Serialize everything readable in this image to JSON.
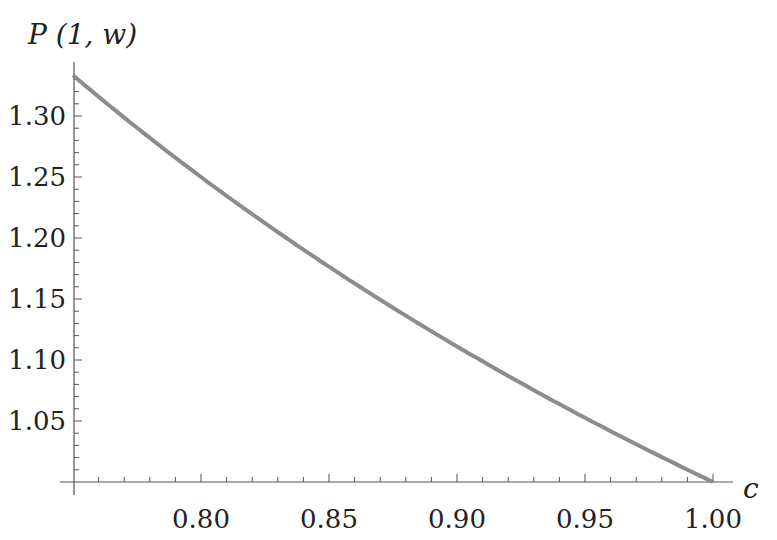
{
  "chart_data": {
    "type": "line",
    "title": "",
    "xlabel": "c",
    "ylabel": "P (1, w)",
    "xlim": [
      0.75,
      1.0
    ],
    "ylim": [
      1.0,
      1.3333
    ],
    "x_ticks": [
      "0.80",
      "0.85",
      "0.90",
      "0.95",
      "1.00"
    ],
    "y_ticks": [
      "1.05",
      "1.10",
      "1.15",
      "1.20",
      "1.25",
      "1.30"
    ],
    "series": [
      {
        "name": "P(1,w)",
        "color": "#8c8c8c",
        "x": [
          0.75,
          0.775,
          0.8,
          0.825,
          0.85,
          0.875,
          0.9,
          0.925,
          0.95,
          0.975,
          1.0
        ],
        "values": [
          1.3333,
          1.2903,
          1.25,
          1.2121,
          1.1765,
          1.1429,
          1.1111,
          1.0811,
          1.0526,
          1.0256,
          1.0
        ]
      }
    ]
  }
}
